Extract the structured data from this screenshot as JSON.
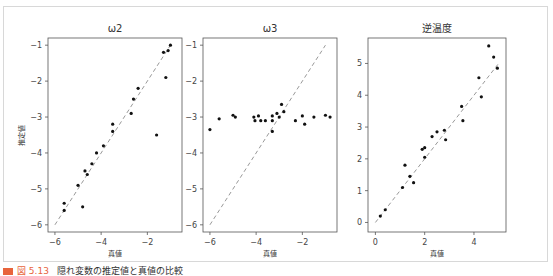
{
  "figure": {
    "ylabel": "推定値",
    "caption": {
      "number": "図 5.13",
      "text": "隠れ変数の推定値と真値の比較"
    }
  },
  "chart_data": [
    {
      "type": "scatter",
      "title": "ω2",
      "xlabel": "真値",
      "ylabel": "推定値",
      "xlim": [
        -6.3,
        -0.5
      ],
      "ylim": [
        -6.2,
        -0.8
      ],
      "xticks": [
        -6,
        -4,
        -2
      ],
      "yticks": [
        -6,
        -5,
        -4,
        -3,
        -2,
        -1
      ],
      "reference_line": {
        "style": "dashed",
        "from": [
          -6,
          -6
        ],
        "to": [
          -1,
          -1
        ]
      },
      "points": [
        [
          -5.6,
          -5.4
        ],
        [
          -5.6,
          -5.6
        ],
        [
          -5.0,
          -4.9
        ],
        [
          -4.8,
          -5.5
        ],
        [
          -4.7,
          -4.5
        ],
        [
          -4.6,
          -4.6
        ],
        [
          -4.4,
          -4.3
        ],
        [
          -4.2,
          -4.0
        ],
        [
          -3.9,
          -3.8
        ],
        [
          -3.5,
          -3.4
        ],
        [
          -3.5,
          -3.2
        ],
        [
          -2.7,
          -2.9
        ],
        [
          -2.6,
          -2.5
        ],
        [
          -2.4,
          -2.2
        ],
        [
          -1.6,
          -3.5
        ],
        [
          -1.3,
          -1.2
        ],
        [
          -1.2,
          -1.9
        ],
        [
          -1.1,
          -1.15
        ],
        [
          -1.0,
          -1.0
        ]
      ],
      "grid": false
    },
    {
      "type": "scatter",
      "title": "ω3",
      "xlabel": "真値",
      "ylabel": "",
      "xlim": [
        -6.3,
        -0.5
      ],
      "ylim": [
        -6.2,
        -0.8
      ],
      "xticks": [
        -6,
        -4,
        -2
      ],
      "yticks": [
        -6,
        -5,
        -4,
        -3,
        -2,
        -1
      ],
      "reference_line": {
        "style": "dashed",
        "from": [
          -6,
          -6
        ],
        "to": [
          -1,
          -1
        ]
      },
      "points": [
        [
          -6.0,
          -3.35
        ],
        [
          -5.6,
          -3.05
        ],
        [
          -5.0,
          -2.95
        ],
        [
          -4.9,
          -3.0
        ],
        [
          -4.1,
          -3.0
        ],
        [
          -4.05,
          -3.1
        ],
        [
          -3.9,
          -2.97
        ],
        [
          -3.8,
          -3.1
        ],
        [
          -3.6,
          -3.1
        ],
        [
          -3.3,
          -3.4
        ],
        [
          -3.3,
          -3.1
        ],
        [
          -3.3,
          -2.97
        ],
        [
          -3.1,
          -2.9
        ],
        [
          -3.0,
          -3.0
        ],
        [
          -2.9,
          -2.65
        ],
        [
          -2.8,
          -2.85
        ],
        [
          -2.3,
          -3.1
        ],
        [
          -2.0,
          -2.97
        ],
        [
          -1.9,
          -3.2
        ],
        [
          -1.5,
          -3.0
        ],
        [
          -1.0,
          -2.95
        ],
        [
          -0.8,
          -3.0
        ]
      ],
      "grid": false
    },
    {
      "type": "scatter",
      "title": "逆温度",
      "xlabel": "真値",
      "ylabel": "",
      "xlim": [
        -0.3,
        5.3
      ],
      "ylim": [
        -0.3,
        5.8
      ],
      "xticks": [
        0,
        2,
        4
      ],
      "yticks": [
        0,
        1,
        2,
        3,
        4,
        5
      ],
      "reference_line": {
        "style": "dashed",
        "from": [
          0,
          0
        ],
        "to": [
          5,
          5
        ]
      },
      "points": [
        [
          0.2,
          0.2
        ],
        [
          0.4,
          0.4
        ],
        [
          1.1,
          1.1
        ],
        [
          1.2,
          1.8
        ],
        [
          1.4,
          1.45
        ],
        [
          1.55,
          1.25
        ],
        [
          1.9,
          2.3
        ],
        [
          2.0,
          2.35
        ],
        [
          2.0,
          2.05
        ],
        [
          2.3,
          2.7
        ],
        [
          2.5,
          2.85
        ],
        [
          2.8,
          2.9
        ],
        [
          2.85,
          2.6
        ],
        [
          3.5,
          3.65
        ],
        [
          3.55,
          3.2
        ],
        [
          4.2,
          4.55
        ],
        [
          4.3,
          3.95
        ],
        [
          4.6,
          5.55
        ],
        [
          4.8,
          5.2
        ],
        [
          4.95,
          4.85
        ]
      ],
      "grid": false
    }
  ],
  "colors": {
    "point": "#111111",
    "reference_line": "#999999",
    "axes": "#555555",
    "caption_accent": "#e8643c"
  }
}
